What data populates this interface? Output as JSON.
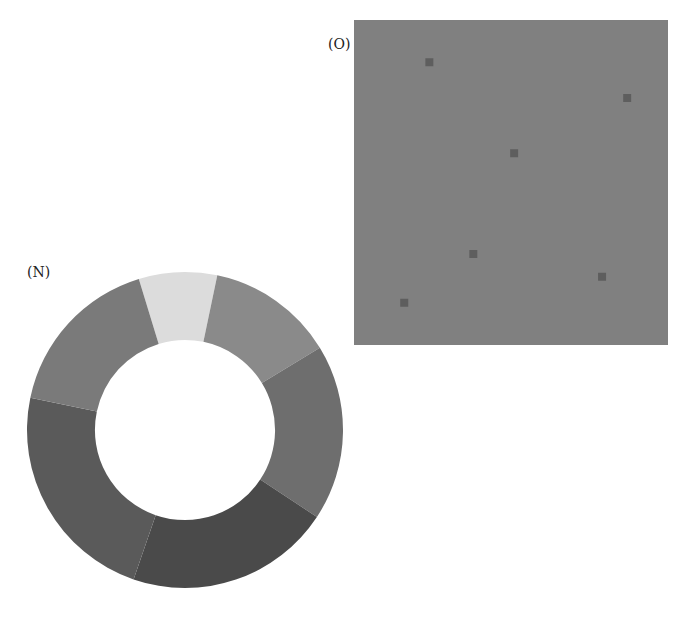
{
  "panels": {
    "n": {
      "label": "(N)"
    },
    "o": {
      "label": "(O)"
    }
  },
  "chart_data": [
    {
      "type": "pie",
      "subtype": "donut",
      "title": "(N)",
      "categories": [
        "s1",
        "s2",
        "s3",
        "s4",
        "s5",
        "s6"
      ],
      "values": [
        8,
        13,
        18,
        21,
        23,
        17
      ],
      "colors": [
        "#dcdcdc",
        "#8a8a8a",
        "#6e6e6e",
        "#4a4a4a",
        "#5a5a5a",
        "#7a7a7a"
      ],
      "start_angle_deg": -17,
      "inner_radius_ratio": 0.57,
      "legend": false
    },
    {
      "type": "scatter",
      "title": "(O)",
      "background": "#808080",
      "marker_color": "#5e5e5e",
      "x": [
        0.24,
        0.87,
        0.51,
        0.38,
        0.79,
        0.16
      ],
      "y": [
        0.87,
        0.76,
        0.59,
        0.28,
        0.21,
        0.13
      ],
      "xlim": [
        0,
        1
      ],
      "ylim": [
        0,
        1
      ],
      "grid": false,
      "axes_visible": false
    }
  ]
}
